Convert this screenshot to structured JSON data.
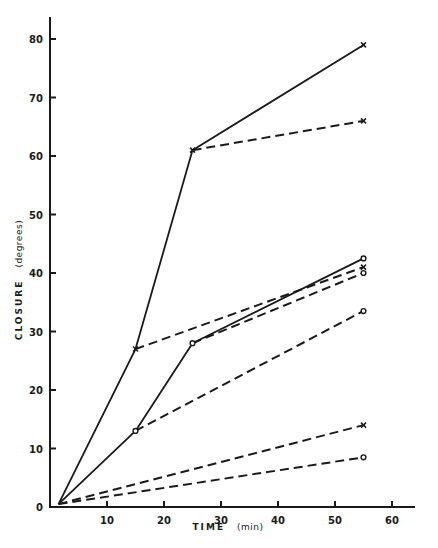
{
  "chart_data": {
    "type": "line",
    "title": "",
    "xlabel": "TIME",
    "xlabel_unit": "(min)",
    "ylabel": "CLOSURE",
    "ylabel_unit": "(degrees)",
    "xlim": [
      0,
      63
    ],
    "ylim": [
      0,
      85
    ],
    "x_ticks": [
      10,
      20,
      30,
      40,
      50,
      60
    ],
    "y_ticks": [
      0,
      10,
      20,
      30,
      40,
      50,
      60,
      70,
      80
    ],
    "grid": false,
    "legend": null,
    "series": [
      {
        "name": "x solid",
        "marker": "x",
        "style": "solid",
        "points": [
          [
            1.5,
            0.5
          ],
          [
            15,
            27
          ],
          [
            25,
            61
          ],
          [
            55,
            79
          ]
        ]
      },
      {
        "name": "x dashed from 25 min",
        "marker": "x",
        "style": "dashed",
        "points": [
          [
            25,
            61
          ],
          [
            55,
            66
          ]
        ]
      },
      {
        "name": "x dashed from 15 min",
        "marker": "x",
        "style": "dashed",
        "points": [
          [
            15,
            27
          ],
          [
            55,
            41
          ]
        ]
      },
      {
        "name": "o solid",
        "marker": "o",
        "style": "solid",
        "points": [
          [
            1.5,
            0.5
          ],
          [
            15,
            13
          ],
          [
            25,
            28
          ],
          [
            55,
            42.5
          ]
        ]
      },
      {
        "name": "o dashed from 25 min",
        "marker": "o",
        "style": "dashed",
        "points": [
          [
            25,
            28
          ],
          [
            55,
            40
          ]
        ]
      },
      {
        "name": "o dashed from 15 min",
        "marker": "o",
        "style": "dashed",
        "points": [
          [
            15,
            13
          ],
          [
            55,
            33.5
          ]
        ]
      },
      {
        "name": "x dashed from 0",
        "marker": "x",
        "style": "dashed",
        "points": [
          [
            1.5,
            0.5
          ],
          [
            55,
            14
          ]
        ]
      },
      {
        "name": "o dashed from 0",
        "marker": "o",
        "style": "dashed",
        "points": [
          [
            1.5,
            0.5
          ],
          [
            55,
            8.5
          ]
        ]
      }
    ]
  },
  "axes": {
    "x_label": "TIME",
    "x_unit": "(min)",
    "y_label": "CLOSURE",
    "y_unit": "(degrees)",
    "x_tick_labels": [
      "10",
      "20",
      "30",
      "40",
      "50",
      "60"
    ],
    "y_tick_labels": [
      "0",
      "10",
      "20",
      "30",
      "40",
      "50",
      "60",
      "70",
      "80"
    ]
  },
  "colors": {
    "ink": "#1a1a1a",
    "background": "#ffffff"
  }
}
